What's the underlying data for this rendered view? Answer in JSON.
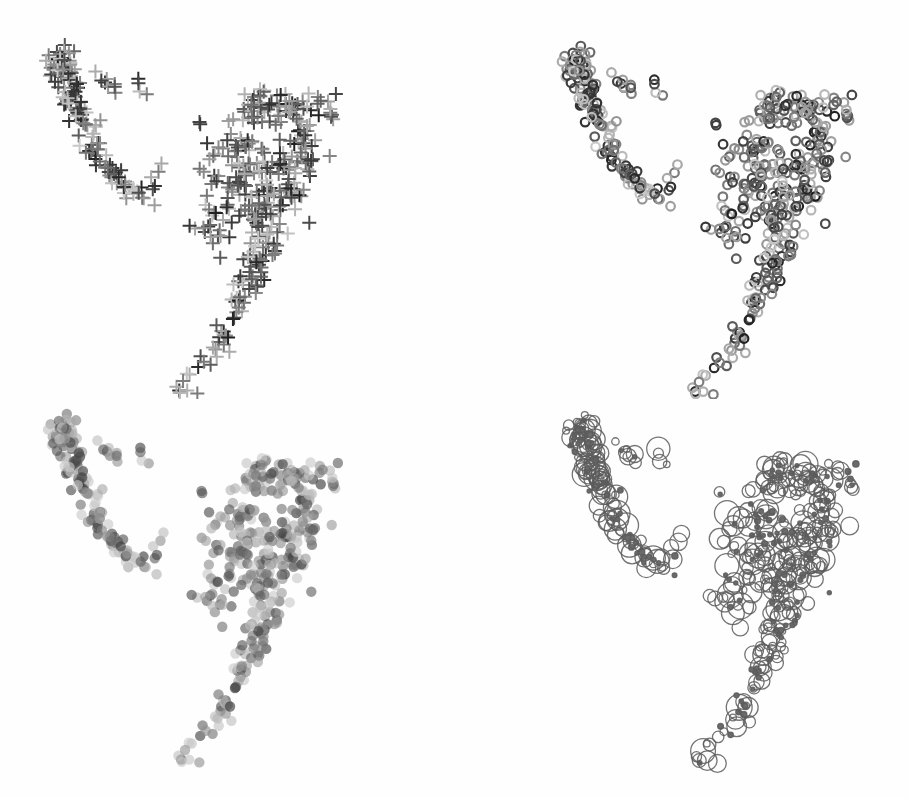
{
  "figure": {
    "background": "#fefefe",
    "panels": [
      {
        "id": "top-left",
        "title": "Plus markers",
        "marker": "plus",
        "x": 0,
        "y": 0,
        "offset": [
          0,
          0
        ]
      },
      {
        "id": "top-right",
        "title": "Open ring markers",
        "marker": "ring",
        "x": 454,
        "y": 0,
        "offset": [
          62,
          1
        ]
      },
      {
        "id": "bottom-left",
        "title": "Translucent filled dots",
        "marker": "dot",
        "x": 0,
        "y": 399,
        "offset": [
          2,
          -30
        ]
      },
      {
        "id": "bottom-right",
        "title": "Size-encoded circles",
        "marker": "sized-circle",
        "x": 454,
        "y": 399,
        "offset": [
          66,
          -29
        ]
      }
    ]
  },
  "chart_data": [
    {
      "type": "scatter",
      "title": "",
      "xlabel": "",
      "ylabel": "",
      "axes": "none",
      "grid": false,
      "legend": "none",
      "marker": "plus (+), grayscale by value",
      "shape": "two clusters: left hooked arm with small floating group; right '7'-shaped cluster with tail down-left",
      "xlim": [
        0,
        454
      ],
      "ylim": [
        399,
        0
      ]
    },
    {
      "type": "scatter",
      "title": "",
      "axes": "none",
      "grid": false,
      "legend": "none",
      "marker": "open ring, grayscale by value",
      "xlim": [
        0,
        454
      ],
      "ylim": [
        399,
        0
      ]
    },
    {
      "type": "scatter",
      "title": "",
      "axes": "none",
      "grid": false,
      "legend": "none",
      "marker": "filled translucent dot, grayscale by value",
      "xlim": [
        0,
        454
      ],
      "ylim": [
        399,
        0
      ]
    },
    {
      "type": "scatter",
      "title": "",
      "axes": "none",
      "grid": false,
      "legend": "none",
      "marker": "open circle, radius encodes value; dense overlaps appear filled",
      "xlim": [
        0,
        454
      ],
      "ylim": [
        399,
        0
      ]
    }
  ],
  "point_model": {
    "seed": 7,
    "segments": [
      {
        "name": "left-arm-top",
        "from": [
          57,
          50
        ],
        "to": [
          75,
          105
        ],
        "n": 70,
        "spread": 7
      },
      {
        "name": "left-arm-mid",
        "from": [
          75,
          105
        ],
        "to": [
          105,
          170
        ],
        "n": 40,
        "spread": 6
      },
      {
        "name": "left-arm-hook",
        "from": [
          105,
          170
        ],
        "to": [
          145,
          198
        ],
        "n": 32,
        "spread": 5
      },
      {
        "name": "left-arm-tip",
        "from": [
          148,
          190
        ],
        "to": [
          163,
          163
        ],
        "n": 5,
        "spread": 3
      },
      {
        "name": "floating-group",
        "from": [
          100,
          78
        ],
        "to": [
          125,
          100
        ],
        "n": 9,
        "spread": 4
      },
      {
        "name": "floating-pair",
        "from": [
          135,
          84
        ],
        "to": [
          152,
          96
        ],
        "n": 4,
        "spread": 3
      },
      {
        "name": "stray",
        "from": [
          192,
          130
        ],
        "to": [
          205,
          120
        ],
        "n": 2,
        "spread": 1
      },
      {
        "name": "main-top",
        "from": [
          245,
          108
        ],
        "to": [
          330,
          112
        ],
        "n": 70,
        "spread": 10
      },
      {
        "name": "main-body-left",
        "from": [
          235,
          130
        ],
        "to": [
          215,
          245
        ],
        "n": 70,
        "spread": 12
      },
      {
        "name": "main-body-right",
        "from": [
          305,
          135
        ],
        "to": [
          280,
          210
        ],
        "n": 70,
        "spread": 11
      },
      {
        "name": "main-center",
        "from": [
          265,
          150
        ],
        "to": [
          255,
          230
        ],
        "n": 60,
        "spread": 12
      },
      {
        "name": "main-lower",
        "from": [
          270,
          230
        ],
        "to": [
          245,
          300
        ],
        "n": 55,
        "spread": 9
      },
      {
        "name": "main-tail",
        "from": [
          245,
          300
        ],
        "to": [
          215,
          345
        ],
        "n": 20,
        "spread": 7
      },
      {
        "name": "tail-tip",
        "from": [
          212,
          350
        ],
        "to": [
          178,
          394
        ],
        "n": 12,
        "spread": 5
      }
    ],
    "gray_range": [
      "#1c1c1c",
      "#c8c8c8"
    ],
    "size_range": [
      2,
      13
    ]
  }
}
